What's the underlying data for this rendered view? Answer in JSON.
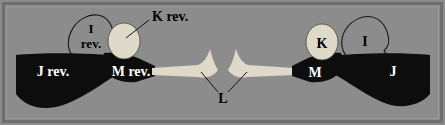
{
  "figure": {
    "type": "anatomical-schematic-diagram",
    "background_color": "#8c8c8c",
    "frame_color": "#767676",
    "dark_shape_color": "#0d0d0d",
    "light_shape_color": "#ded9c8",
    "outline_color": "#1a1a1a",
    "label_dark_color": "#000000",
    "label_light_color": "#ffffff",
    "labels": {
      "left_i_rev_line1": "I",
      "left_i_rev_line2": "rev.",
      "left_k_rev": "K rev.",
      "left_j_rev": "J rev.",
      "left_m_rev": "M rev.",
      "center_l": "L",
      "right_k": "K",
      "right_i": "I",
      "right_m": "M",
      "right_j": "J"
    },
    "regions": [
      {
        "id": "left-j-rev",
        "label": "J rev.",
        "fill": "dark",
        "side": "left"
      },
      {
        "id": "left-m-rev",
        "label": "M rev.",
        "fill": "dark",
        "side": "left"
      },
      {
        "id": "left-k-rev",
        "label": "K rev.",
        "fill": "light",
        "side": "left"
      },
      {
        "id": "left-i-rev",
        "label": "I rev.",
        "fill": "outline",
        "side": "left"
      },
      {
        "id": "center-l",
        "label": "L",
        "fill": "light",
        "side": "center"
      },
      {
        "id": "right-m",
        "label": "M",
        "fill": "dark",
        "side": "right"
      },
      {
        "id": "right-j",
        "label": "J",
        "fill": "dark",
        "side": "right"
      },
      {
        "id": "right-k",
        "label": "K",
        "fill": "light",
        "side": "right"
      },
      {
        "id": "right-i",
        "label": "I",
        "fill": "outline",
        "side": "right"
      }
    ]
  }
}
